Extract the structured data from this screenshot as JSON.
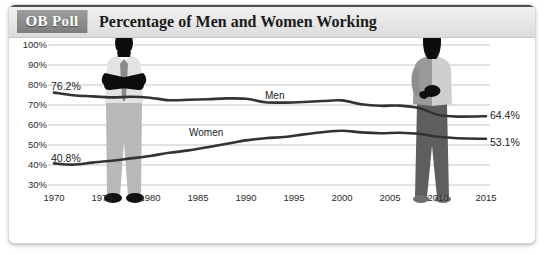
{
  "header": {
    "badge_label": "OB Poll",
    "title": "Percentage of Men and Women Working"
  },
  "chart_data": {
    "type": "line",
    "title": "Percentage of Men and Women Working",
    "xlabel": "",
    "ylabel": "",
    "xlim": [
      1970,
      2015
    ],
    "ylim": [
      30,
      100
    ],
    "grid": true,
    "legend_position": "inline",
    "xticks": [
      "1970",
      "1975",
      "1980",
      "1985",
      "1990",
      "1995",
      "2000",
      "2005",
      "2010",
      "2015"
    ],
    "yticks": [
      "30%",
      "40%",
      "50%",
      "60%",
      "70%",
      "80%",
      "90%",
      "100%"
    ],
    "annotations": [
      {
        "name": "men-start",
        "text": "76.2%",
        "x": 1970,
        "y": 76.2
      },
      {
        "name": "men-end",
        "text": "64.4%",
        "x": 2015,
        "y": 64.4
      },
      {
        "name": "women-start",
        "text": "40.8%",
        "x": 1970,
        "y": 40.8
      },
      {
        "name": "women-end",
        "text": "53.1%",
        "x": 2015,
        "y": 53.1
      }
    ],
    "series": [
      {
        "name": "Men",
        "label": "Men",
        "color": "#333333",
        "x": [
          1970,
          1972,
          1974,
          1976,
          1978,
          1980,
          1982,
          1984,
          1986,
          1988,
          1990,
          1992,
          1994,
          1996,
          1998,
          2000,
          2002,
          2004,
          2006,
          2008,
          2010,
          2012,
          2015
        ],
        "values": [
          76.2,
          74.9,
          74.3,
          73.8,
          74.1,
          73.6,
          72.4,
          72.6,
          72.9,
          73.3,
          73.1,
          71.4,
          71.2,
          71.5,
          72.0,
          72.3,
          70.4,
          69.6,
          69.7,
          68.5,
          65.1,
          64.2,
          64.4
        ]
      },
      {
        "name": "Women",
        "label": "Women",
        "color": "#333333",
        "x": [
          1970,
          1972,
          1974,
          1976,
          1978,
          1980,
          1982,
          1984,
          1986,
          1988,
          1990,
          1992,
          1994,
          1996,
          1998,
          2000,
          2002,
          2004,
          2006,
          2008,
          2010,
          2012,
          2015
        ],
        "values": [
          40.8,
          40.2,
          41.2,
          42.1,
          43.3,
          44.5,
          46.1,
          47.3,
          48.9,
          50.6,
          52.3,
          53.4,
          54.0,
          55.3,
          56.4,
          57.1,
          56.3,
          55.9,
          56.1,
          55.6,
          54.1,
          53.4,
          53.1
        ]
      }
    ]
  },
  "figures": {
    "man": {
      "name": "man-silhouette",
      "year": 1975
    },
    "woman": {
      "name": "woman-silhouette",
      "year": 2005
    }
  }
}
